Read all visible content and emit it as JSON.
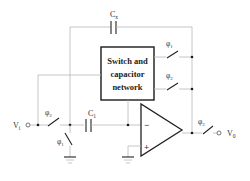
{
  "diagram": {
    "type": "switched-capacitor circuit schematic",
    "block": {
      "line1": "Switch and",
      "line2": "capacitor",
      "line3": "network"
    },
    "labels": {
      "feedback_cap": "C",
      "feedback_cap_sub": "x",
      "input_cap": "C",
      "input_cap_sub": "1",
      "phi": "φ",
      "sub1": "1",
      "sub2": "2",
      "input": "V",
      "input_sub": "i",
      "output": "V",
      "output_sub": "0",
      "minus": "−",
      "plus": "+"
    },
    "switches": [
      {
        "id": "sw-network-top",
        "phase": "φ1"
      },
      {
        "id": "sw-network-bottom",
        "phase": "φ2"
      },
      {
        "id": "sw-input-series",
        "phase": "φ2"
      },
      {
        "id": "sw-input-shunt",
        "phase": "φ1"
      },
      {
        "id": "sw-output",
        "phase": "φ2"
      }
    ],
    "colors": {
      "wire": "#b8b8b8",
      "component": "#222222",
      "background": "#ffffff"
    }
  }
}
